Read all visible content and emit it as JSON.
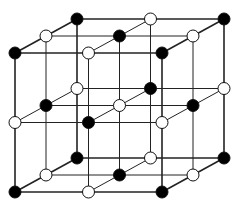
{
  "diagram": {
    "type": "crystal-lattice",
    "grid_size": [
      3,
      3,
      3
    ],
    "projection": {
      "origin": [
        15,
        53
      ],
      "step_x": 73.5,
      "step_y": 69.5,
      "depth_dx": 31,
      "depth_dy": -17
    },
    "atom_radius": 6,
    "colors": {
      "line": "#222222",
      "atom_black_fill": "#000000",
      "atom_white_fill": "#ffffff",
      "atom_stroke": "#111111",
      "background": "#ffffff"
    },
    "coloring_rule": "black when (i+j+k) is even, white otherwise",
    "atom_types": [
      {
        "name": "black-atom",
        "fill": "#000000"
      },
      {
        "name": "white-atom",
        "fill": "#ffffff"
      }
    ]
  }
}
